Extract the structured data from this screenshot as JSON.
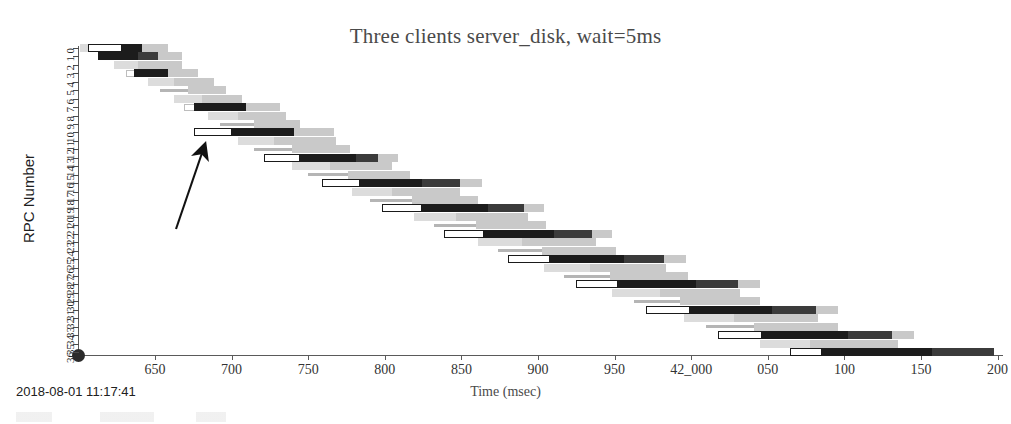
{
  "chart_data": {
    "type": "bar",
    "title": "Three clients server_disk, wait=5ms",
    "xlabel": "Time (msec)",
    "ylabel": "RPC Number",
    "xlim": [
      620,
      42240
    ],
    "ylim": [
      0,
      36
    ],
    "grid": false,
    "legend": null,
    "xtick_labels": [
      "650",
      "700",
      "750",
      "800",
      "850",
      "900",
      "950",
      "42_000",
      "050",
      "100",
      "150",
      "200"
    ],
    "xtick_values": [
      650,
      700,
      750,
      800,
      850,
      900,
      950,
      42000,
      42050,
      42100,
      42150,
      42200
    ],
    "ytick_labels": [
      "0",
      "1",
      "2",
      "3",
      "4",
      "5",
      "6",
      "7",
      "8",
      "9",
      "10",
      "11",
      "12",
      "13",
      "14",
      "15",
      "16",
      "17",
      "18",
      "19",
      "20",
      "21",
      "22",
      "23",
      "24",
      "25",
      "26",
      "27",
      "28",
      "29",
      "30",
      "31",
      "32",
      "33",
      "34",
      "35",
      "36"
    ],
    "categories": [
      "0",
      "1",
      "2",
      "3",
      "4",
      "5",
      "6",
      "7",
      "8",
      "9",
      "10",
      "11",
      "12",
      "13",
      "14",
      "15",
      "16",
      "17",
      "18",
      "19",
      "20",
      "21",
      "22",
      "23",
      "24",
      "25",
      "26",
      "27",
      "28",
      "29",
      "30",
      "31",
      "32",
      "33",
      "34",
      "35",
      "36"
    ],
    "values": [
      641,
      646,
      652,
      658,
      664,
      670,
      677,
      683,
      689,
      695,
      701,
      708,
      714,
      720,
      727,
      733,
      739,
      746,
      752,
      759,
      765,
      772,
      778,
      785,
      791,
      798,
      804,
      811,
      817,
      824,
      830,
      837,
      843,
      850,
      856,
      863,
      869
    ],
    "series": [
      {
        "name": "rpc-start-box",
        "values": [
          641,
          646,
          652,
          658,
          664,
          670,
          677,
          683,
          689,
          695,
          701,
          708,
          714,
          720,
          727,
          733,
          739,
          746,
          752,
          759,
          765,
          772,
          778,
          785,
          791,
          798,
          804,
          811,
          817,
          824,
          830,
          837,
          843,
          850,
          856,
          863,
          869
        ]
      },
      {
        "name": "rpc-duration-msec",
        "values": [
          52,
          54,
          53,
          56,
          55,
          57,
          58,
          56,
          60,
          59,
          61,
          63,
          62,
          64,
          66,
          65,
          67,
          69,
          68,
          70,
          72,
          71,
          73,
          75,
          74,
          76,
          78,
          77,
          79,
          81,
          80,
          82,
          84,
          83,
          85,
          87,
          86
        ]
      }
    ],
    "rows": [
      {
        "rpc": 0,
        "segments": [
          {
            "kind": "faint",
            "x": 2,
            "w": 44
          },
          {
            "kind": "box",
            "x": 10,
            "w": 34
          },
          {
            "kind": "dark",
            "x": 44,
            "w": 20
          },
          {
            "kind": "light",
            "x": 64,
            "w": 26
          }
        ]
      },
      {
        "rpc": 1,
        "segments": [
          {
            "kind": "ghostbox",
            "x": 22,
            "w": 30
          },
          {
            "kind": "dark",
            "x": 20,
            "w": 40
          },
          {
            "kind": "mid",
            "x": 60,
            "w": 20
          },
          {
            "kind": "light",
            "x": 80,
            "w": 24
          }
        ]
      },
      {
        "rpc": 2,
        "segments": [
          {
            "kind": "faint",
            "x": 36,
            "w": 38
          },
          {
            "kind": "light",
            "x": 60,
            "w": 44
          }
        ]
      },
      {
        "rpc": 3,
        "segments": [
          {
            "kind": "ghostbox",
            "x": 48,
            "w": 26
          },
          {
            "kind": "dark",
            "x": 56,
            "w": 34
          },
          {
            "kind": "light",
            "x": 90,
            "w": 30
          }
        ]
      },
      {
        "rpc": 4,
        "segments": [
          {
            "kind": "faint",
            "x": 70,
            "w": 40
          },
          {
            "kind": "light",
            "x": 96,
            "w": 40
          }
        ]
      },
      {
        "rpc": 5,
        "segments": [
          {
            "kind": "hairline",
            "x": 82,
            "w": 46
          },
          {
            "kind": "light",
            "x": 110,
            "w": 38
          }
        ]
      },
      {
        "rpc": 6,
        "segments": [
          {
            "kind": "faint",
            "x": 96,
            "w": 42
          },
          {
            "kind": "light",
            "x": 124,
            "w": 40
          }
        ]
      },
      {
        "rpc": 7,
        "segments": [
          {
            "kind": "ghostbox",
            "x": 106,
            "w": 28
          },
          {
            "kind": "dark",
            "x": 116,
            "w": 52
          },
          {
            "kind": "light",
            "x": 168,
            "w": 34
          }
        ]
      },
      {
        "rpc": 8,
        "segments": [
          {
            "kind": "faint",
            "x": 130,
            "w": 44
          },
          {
            "kind": "light",
            "x": 160,
            "w": 48
          }
        ]
      },
      {
        "rpc": 9,
        "segments": [
          {
            "kind": "hairline",
            "x": 142,
            "w": 50
          },
          {
            "kind": "light",
            "x": 176,
            "w": 46
          }
        ]
      },
      {
        "rpc": 10,
        "segments": [
          {
            "kind": "box",
            "x": 116,
            "w": 38
          },
          {
            "kind": "dark",
            "x": 154,
            "w": 62
          },
          {
            "kind": "light",
            "x": 216,
            "w": 40
          }
        ]
      },
      {
        "rpc": 11,
        "segments": [
          {
            "kind": "faint",
            "x": 160,
            "w": 54
          },
          {
            "kind": "light",
            "x": 196,
            "w": 62
          }
        ]
      },
      {
        "rpc": 12,
        "segments": [
          {
            "kind": "hairline",
            "x": 176,
            "w": 58
          },
          {
            "kind": "light",
            "x": 214,
            "w": 58
          }
        ]
      },
      {
        "rpc": 13,
        "segments": [
          {
            "kind": "box",
            "x": 186,
            "w": 36
          },
          {
            "kind": "dark",
            "x": 222,
            "w": 56
          },
          {
            "kind": "mid",
            "x": 278,
            "w": 22
          },
          {
            "kind": "light",
            "x": 300,
            "w": 20
          }
        ]
      },
      {
        "rpc": 14,
        "segments": [
          {
            "kind": "faint",
            "x": 214,
            "w": 60
          },
          {
            "kind": "light",
            "x": 252,
            "w": 62
          }
        ]
      },
      {
        "rpc": 15,
        "segments": [
          {
            "kind": "hairline",
            "x": 230,
            "w": 62
          },
          {
            "kind": "light",
            "x": 270,
            "w": 62
          }
        ]
      },
      {
        "rpc": 16,
        "segments": [
          {
            "kind": "box",
            "x": 244,
            "w": 38
          },
          {
            "kind": "dark",
            "x": 282,
            "w": 62
          },
          {
            "kind": "mid",
            "x": 344,
            "w": 38
          },
          {
            "kind": "light",
            "x": 382,
            "w": 22
          }
        ]
      },
      {
        "rpc": 17,
        "segments": [
          {
            "kind": "faint",
            "x": 274,
            "w": 64
          },
          {
            "kind": "light",
            "x": 314,
            "w": 68
          }
        ]
      },
      {
        "rpc": 18,
        "segments": [
          {
            "kind": "hairline",
            "x": 292,
            "w": 66
          },
          {
            "kind": "light",
            "x": 334,
            "w": 66
          }
        ]
      },
      {
        "rpc": 19,
        "segments": [
          {
            "kind": "box",
            "x": 304,
            "w": 40
          },
          {
            "kind": "dark",
            "x": 344,
            "w": 66
          },
          {
            "kind": "mid",
            "x": 410,
            "w": 36
          },
          {
            "kind": "light",
            "x": 446,
            "w": 20
          }
        ]
      },
      {
        "rpc": 20,
        "segments": [
          {
            "kind": "faint",
            "x": 336,
            "w": 68
          },
          {
            "kind": "light",
            "x": 378,
            "w": 72
          }
        ]
      },
      {
        "rpc": 21,
        "segments": [
          {
            "kind": "hairline",
            "x": 356,
            "w": 68
          },
          {
            "kind": "light",
            "x": 398,
            "w": 70
          }
        ]
      },
      {
        "rpc": 22,
        "segments": [
          {
            "kind": "box",
            "x": 366,
            "w": 40
          },
          {
            "kind": "dark",
            "x": 406,
            "w": 70
          },
          {
            "kind": "mid",
            "x": 476,
            "w": 38
          },
          {
            "kind": "light",
            "x": 514,
            "w": 20
          }
        ]
      },
      {
        "rpc": 23,
        "segments": [
          {
            "kind": "faint",
            "x": 400,
            "w": 72
          },
          {
            "kind": "light",
            "x": 444,
            "w": 74
          }
        ]
      },
      {
        "rpc": 24,
        "segments": [
          {
            "kind": "hairline",
            "x": 420,
            "w": 72
          },
          {
            "kind": "light",
            "x": 464,
            "w": 74
          }
        ]
      },
      {
        "rpc": 25,
        "segments": [
          {
            "kind": "box",
            "x": 430,
            "w": 42
          },
          {
            "kind": "dark",
            "x": 472,
            "w": 74
          },
          {
            "kind": "mid",
            "x": 546,
            "w": 40
          },
          {
            "kind": "light",
            "x": 586,
            "w": 22
          }
        ]
      },
      {
        "rpc": 26,
        "segments": [
          {
            "kind": "faint",
            "x": 466,
            "w": 74
          },
          {
            "kind": "light",
            "x": 512,
            "w": 76
          }
        ]
      },
      {
        "rpc": 27,
        "segments": [
          {
            "kind": "hairline",
            "x": 486,
            "w": 76
          },
          {
            "kind": "light",
            "x": 532,
            "w": 78
          }
        ]
      },
      {
        "rpc": 28,
        "segments": [
          {
            "kind": "box",
            "x": 498,
            "w": 42
          },
          {
            "kind": "dark",
            "x": 540,
            "w": 78
          },
          {
            "kind": "mid",
            "x": 618,
            "w": 42
          },
          {
            "kind": "light",
            "x": 660,
            "w": 22
          }
        ]
      },
      {
        "rpc": 29,
        "segments": [
          {
            "kind": "faint",
            "x": 534,
            "w": 78
          },
          {
            "kind": "light",
            "x": 582,
            "w": 80
          }
        ]
      },
      {
        "rpc": 30,
        "segments": [
          {
            "kind": "hairline",
            "x": 556,
            "w": 78
          },
          {
            "kind": "light",
            "x": 602,
            "w": 80
          }
        ]
      },
      {
        "rpc": 31,
        "segments": [
          {
            "kind": "box",
            "x": 568,
            "w": 44
          },
          {
            "kind": "dark",
            "x": 612,
            "w": 82
          },
          {
            "kind": "mid",
            "x": 694,
            "w": 44
          },
          {
            "kind": "light",
            "x": 738,
            "w": 22
          }
        ]
      },
      {
        "rpc": 32,
        "segments": [
          {
            "kind": "faint",
            "x": 606,
            "w": 80
          },
          {
            "kind": "light",
            "x": 656,
            "w": 84
          }
        ]
      },
      {
        "rpc": 33,
        "segments": [
          {
            "kind": "hairline",
            "x": 628,
            "w": 82
          },
          {
            "kind": "light",
            "x": 676,
            "w": 84
          }
        ]
      },
      {
        "rpc": 34,
        "segments": [
          {
            "kind": "box",
            "x": 640,
            "w": 44
          },
          {
            "kind": "dark",
            "x": 684,
            "w": 86
          },
          {
            "kind": "mid",
            "x": 770,
            "w": 44
          },
          {
            "kind": "light",
            "x": 814,
            "w": 22
          }
        ]
      },
      {
        "rpc": 35,
        "segments": [
          {
            "kind": "faint",
            "x": 682,
            "w": 84
          },
          {
            "kind": "light",
            "x": 732,
            "w": 88
          }
        ]
      },
      {
        "rpc": 36,
        "segments": [
          {
            "kind": "box",
            "x": 712,
            "w": 32
          },
          {
            "kind": "dark",
            "x": 744,
            "w": 110
          },
          {
            "kind": "mid",
            "x": 854,
            "w": 62
          }
        ]
      }
    ],
    "annotations": [
      {
        "type": "arrow",
        "label": "arrow-annotation",
        "from_x": 175,
        "from_y": 228,
        "to_x": 202,
        "to_y": 146
      }
    ]
  },
  "footer": {
    "timestamp": "2018-08-01 11:17:41"
  },
  "colors": {
    "dark_bar": "#1c1c1c",
    "mid_bar": "#3b3b3b",
    "light_bar": "#c9c9c9",
    "faint_bar": "#dcdcdc",
    "axis": "#5a5a5a",
    "title_text": "#4a4a4a",
    "background": "#ffffff"
  }
}
